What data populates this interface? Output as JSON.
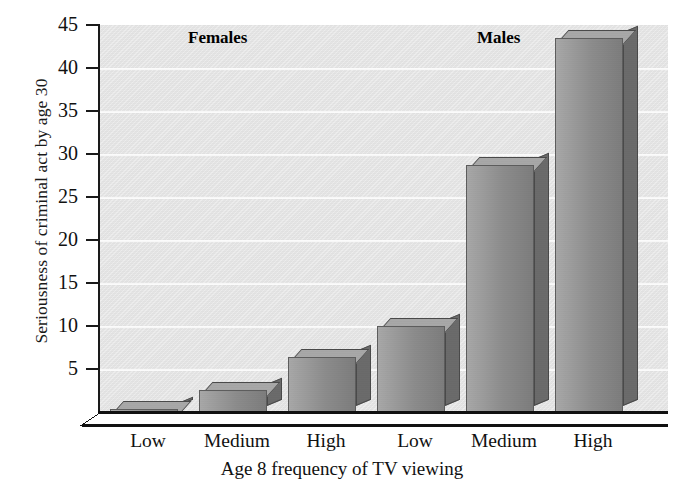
{
  "chart_data": {
    "type": "bar",
    "title": "",
    "xlabel": "Age 8 frequency of TV viewing",
    "ylabel": "Seriousness of criminal act by age 30",
    "categories": [
      "Low",
      "Medium",
      "High",
      "Low",
      "Medium",
      "High"
    ],
    "values": [
      0.3,
      2.6,
      6.4,
      10.0,
      28.7,
      43.5
    ],
    "groups": [
      {
        "name": "Females",
        "categories": [
          "Low",
          "Medium",
          "High"
        ],
        "values": [
          0.3,
          2.6,
          6.4
        ]
      },
      {
        "name": "Males",
        "categories": [
          "Low",
          "Medium",
          "High"
        ],
        "values": [
          10.0,
          28.7,
          43.5
        ]
      }
    ],
    "ylim": [
      0,
      45
    ],
    "yticks": [
      45,
      40,
      35,
      30,
      25,
      20,
      15,
      10,
      5
    ],
    "ytick_labels": [
      "45",
      "40",
      "35",
      "30",
      "25",
      "20",
      "15",
      "10",
      "5"
    ],
    "grid": true,
    "grid_axis": "y",
    "legend": "none",
    "style": "3d-bar-grayscale",
    "colors": {
      "plot_background": "#e7e7e7",
      "gridline": "#fbfbfb",
      "axis": "#111111",
      "bar_front": "#8c8c8c",
      "bar_side": "#6b6b6b",
      "bar_top": "#a8a8a8",
      "text": "#111111"
    }
  },
  "axis": {
    "y_title": "Seriousness of criminal act by age 30",
    "x_title": "Age 8 frequency of TV viewing"
  },
  "group_labels": {
    "females": "Females",
    "males": "Males"
  }
}
